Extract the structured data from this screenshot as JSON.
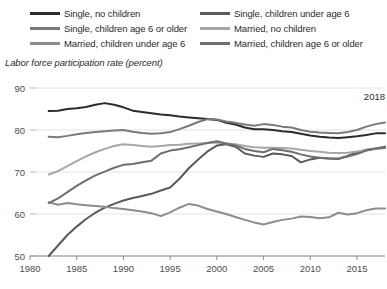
{
  "legend": {
    "columns": [
      {
        "items": [
          {
            "label": "Single, no children",
            "color": "#2b2b2b"
          },
          {
            "label": "Single, children age 6 or older",
            "color": "#7a7a7a"
          },
          {
            "label": "Married, children under age 6",
            "color": "#8c8c8c"
          }
        ]
      },
      {
        "items": [
          {
            "label": "Single, children under age 6",
            "color": "#5a5a5a"
          },
          {
            "label": "Married, no children",
            "color": "#a6a6a6"
          },
          {
            "label": "Married, children age 6 or older",
            "color": "#6e6e6e"
          }
        ]
      }
    ]
  },
  "annotation": {
    "text": "2018"
  },
  "chart_data": {
    "type": "line",
    "title": "",
    "subtitle": "",
    "ylabel": "Labor force participation rate (percent)",
    "xlabel": "",
    "xlim": [
      1980,
      2018
    ],
    "ylim": [
      50,
      90
    ],
    "yticks": [
      50,
      60,
      70,
      80,
      90
    ],
    "xticks": [
      1980,
      1985,
      1990,
      1995,
      2000,
      2005,
      2010,
      2015
    ],
    "grid": "horizontal",
    "legend_position": "top",
    "annotations": [
      {
        "text": "2018",
        "x": 2018,
        "y": 88
      }
    ],
    "x": [
      1982,
      1983,
      1984,
      1985,
      1986,
      1987,
      1988,
      1989,
      1990,
      1991,
      1992,
      1993,
      1994,
      1995,
      1996,
      1997,
      1998,
      1999,
      2000,
      2001,
      2002,
      2003,
      2004,
      2005,
      2006,
      2007,
      2008,
      2009,
      2010,
      2011,
      2012,
      2013,
      2014,
      2015,
      2016,
      2017,
      2018
    ],
    "series": [
      {
        "name": "Single, no children",
        "color": "#2b2b2b",
        "values": [
          84.5,
          84.6,
          85.0,
          85.2,
          85.5,
          86.0,
          86.4,
          86.0,
          85.4,
          84.6,
          84.3,
          84.0,
          83.7,
          83.5,
          83.2,
          83.0,
          82.8,
          82.6,
          82.4,
          81.7,
          81.3,
          80.6,
          80.2,
          80.2,
          80.0,
          79.7,
          79.5,
          79.1,
          78.7,
          78.4,
          78.2,
          78.1,
          78.3,
          78.5,
          78.8,
          79.2,
          79.2
        ]
      },
      {
        "name": "Single, children under age 6",
        "color": "#5a5a5a",
        "values": [
          50.0,
          52.5,
          55.0,
          57.0,
          58.8,
          60.3,
          61.5,
          62.4,
          63.2,
          63.8,
          64.3,
          64.8,
          65.6,
          66.3,
          68.4,
          70.9,
          73.0,
          74.9,
          76.3,
          76.6,
          76.0,
          74.4,
          73.9,
          73.6,
          74.4,
          74.2,
          73.8,
          72.3,
          73.0,
          73.4,
          73.2,
          73.1,
          73.8,
          74.7,
          75.3,
          75.6,
          76.0
        ]
      },
      {
        "name": "Single, children age 6 or older",
        "color": "#7a7a7a",
        "values": [
          78.4,
          78.3,
          78.6,
          79.0,
          79.3,
          79.5,
          79.7,
          79.9,
          80.0,
          79.6,
          79.3,
          79.1,
          79.2,
          79.5,
          80.2,
          81.0,
          81.9,
          82.6,
          82.5,
          82.0,
          81.7,
          81.3,
          81.0,
          81.4,
          81.2,
          80.8,
          80.6,
          80.0,
          79.6,
          79.4,
          79.3,
          79.2,
          79.5,
          80.0,
          80.8,
          81.4,
          81.8
        ]
      },
      {
        "name": "Married, no children",
        "color": "#a6a6a6",
        "values": [
          69.4,
          70.2,
          71.4,
          72.6,
          73.7,
          74.7,
          75.5,
          76.2,
          76.6,
          76.4,
          76.2,
          76.0,
          76.2,
          76.4,
          76.5,
          76.7,
          76.8,
          76.9,
          77.0,
          76.8,
          76.6,
          76.2,
          75.9,
          75.8,
          75.8,
          75.7,
          75.6,
          75.3,
          75.0,
          74.8,
          74.6,
          74.5,
          74.6,
          74.9,
          75.2,
          75.5,
          75.7
        ]
      },
      {
        "name": "Married, children under age 6",
        "color": "#8c8c8c",
        "values": [
          62.8,
          62.2,
          62.6,
          62.3,
          62.1,
          61.9,
          61.7,
          61.4,
          61.2,
          60.9,
          60.6,
          60.2,
          59.5,
          60.4,
          61.5,
          62.4,
          62.0,
          61.2,
          60.6,
          60.0,
          59.3,
          58.6,
          58.0,
          57.5,
          58.1,
          58.6,
          58.9,
          59.4,
          59.3,
          59.0,
          59.2,
          60.3,
          59.9,
          60.2,
          60.9,
          61.3,
          61.3
        ]
      },
      {
        "name": "Married, children age 6 or older",
        "color": "#6e6e6e",
        "values": [
          62.6,
          63.7,
          65.2,
          66.7,
          68.0,
          69.2,
          70.1,
          71.0,
          71.7,
          71.9,
          72.3,
          72.7,
          74.4,
          75.1,
          75.4,
          75.9,
          76.4,
          76.9,
          77.3,
          76.8,
          76.3,
          75.5,
          75.0,
          74.7,
          75.5,
          75.2,
          74.8,
          74.2,
          73.7,
          73.4,
          73.2,
          73.2,
          73.7,
          74.3,
          75.1,
          75.6,
          75.8
        ]
      }
    ]
  }
}
